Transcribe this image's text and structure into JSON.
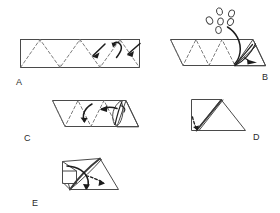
{
  "figure": {
    "background_color": "#ffffff",
    "line_color": "#4a4a4a",
    "fold_line_color": "#6d6d6d",
    "arrow_color": "#1c1c1c",
    "width": 280,
    "height": 213
  },
  "panels": [
    {
      "id": "A",
      "label": "A",
      "label_x": 16,
      "label_y": 78,
      "caption": "Flat strip with accordion zigzag fold lines and three curved arrows at right"
    },
    {
      "id": "B",
      "label": "B",
      "label_x": 262,
      "label_y": 73,
      "caption": "Strip with right end folded into a triangular pocket, sprinkles falling in"
    },
    {
      "id": "C",
      "label": "C",
      "label_x": 24,
      "label_y": 134,
      "caption": "Strip rolling up, two curved arrows pointing left over the zigzag"
    },
    {
      "id": "D",
      "label": "D",
      "label_x": 253,
      "label_y": 133,
      "caption": "Folded square with diagonal triangle flap and small tuck arrow"
    },
    {
      "id": "E",
      "label": "E",
      "label_x": 32,
      "label_y": 199,
      "caption": "Finished three dimensional cone shape with rotation arrows"
    }
  ],
  "annotations": {
    "bubble_count": 6,
    "bubble_meaning": "falling-filling",
    "arrow_meaning": "fold-direction",
    "dash_meaning": "valley-fold-crease"
  }
}
